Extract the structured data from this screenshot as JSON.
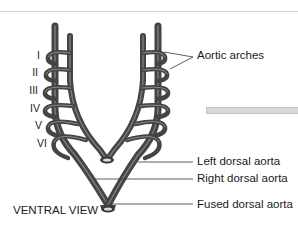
{
  "diagram": {
    "view_label": "VENTRAL VIEW",
    "arch_numerals": [
      "I",
      "II",
      "III",
      "IV",
      "V",
      "VI"
    ],
    "labels": {
      "aortic_arches": "Aortic arches",
      "left_dorsal_aorta": "Left dorsal aorta",
      "right_dorsal_aorta": "Right dorsal aorta",
      "fused_dorsal_aorta": "Fused dorsal aorta"
    },
    "colors": {
      "vessel": "#4a4a4a",
      "vessel_highlight": "#8a8a8a",
      "leader_line": "#333333",
      "text": "#1a1a1a"
    }
  }
}
